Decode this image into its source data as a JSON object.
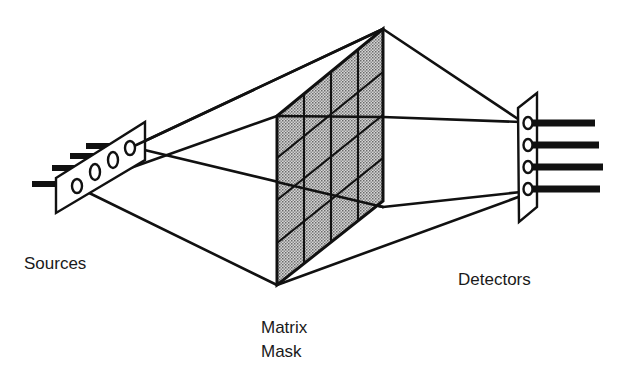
{
  "diagram": {
    "labels": {
      "sources": "Sources",
      "mask_line1": "Matrix",
      "mask_line2": "Mask",
      "detectors": "Detectors"
    },
    "components": {
      "sources": {
        "count": 4,
        "label": "Sources"
      },
      "mask": {
        "rows": 4,
        "columns": 4,
        "fill": "stippled-gray",
        "label": "Matrix Mask"
      },
      "detectors": {
        "count": 4,
        "label": "Detectors"
      }
    },
    "colors": {
      "ink": "#111111",
      "mask_fill": "#b8b8b8",
      "background": "#ffffff"
    }
  }
}
